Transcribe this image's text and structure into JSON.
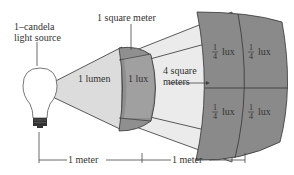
{
  "diagram": {
    "labels": {
      "source": [
        "1–candela",
        "light source"
      ],
      "square_meter": "1 square meter",
      "lumen": "1 lumen",
      "lux": "1 lux",
      "four_sq": [
        "4 square",
        "meters"
      ],
      "quarter_num": "1",
      "quarter_den": "4",
      "quarter_unit": "lux",
      "distance1": "1 meter",
      "distance2": "1 meter"
    },
    "colors": {
      "cone_light": "#e8e8e8",
      "patch_dark": "#8a8a8a",
      "outline": "#333333",
      "bulb_base": "#333333",
      "background": "#ffffff"
    }
  }
}
